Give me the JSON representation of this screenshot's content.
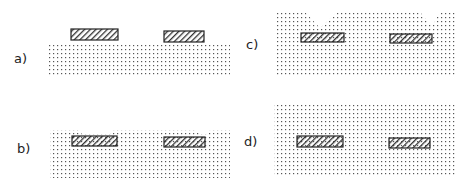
{
  "figure": {
    "panels": [
      {
        "id": "a",
        "label": "a)"
      },
      {
        "id": "b",
        "label": "b)"
      },
      {
        "id": "c",
        "label": "c)"
      },
      {
        "id": "d",
        "label": "d)"
      }
    ],
    "legend_semantics": {
      "dotted": "stippled layer (substrate / deposited film)",
      "hatched": "hatched rectangular blocks (embedded features)"
    },
    "colors": {
      "ink": "#222222",
      "dot": "#555555",
      "background": "#ffffff"
    }
  }
}
